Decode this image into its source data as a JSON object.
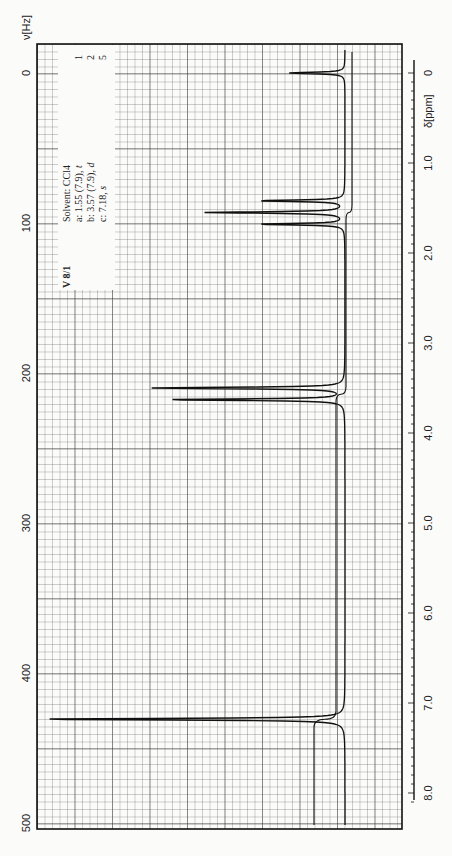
{
  "chart_data": {
    "type": "line",
    "spectrum_id": "V 8/1",
    "solvent": "Solvent: CCl4",
    "xlabel_hz": "ν[Hz]",
    "xlabel_ppm": "δ[ppm]",
    "hz_ticks": [
      0,
      100,
      200,
      300,
      400,
      500
    ],
    "hz_tick_labels": [
      "0",
      "100",
      "200",
      "300",
      "400",
      "500"
    ],
    "ppm_ticks": [
      0,
      1.0,
      2.0,
      3.0,
      4.0,
      5.0,
      6.0,
      7.0,
      8.0
    ],
    "ppm_tick_labels": [
      "0",
      "1.0",
      "2.0",
      "3.0",
      "4.0",
      "5.0",
      "6.0",
      "7.0",
      "8.0"
    ],
    "xlim_hz": [
      0,
      500
    ],
    "xlim_ppm": [
      0,
      8.33
    ],
    "grid": true,
    "assignments": [
      {
        "label": "a:",
        "text": "1.55 (7.9),",
        "mult": "t",
        "shift_ppm": 1.55,
        "J_hz": 7.9,
        "multiplicity": "t",
        "integral": 1
      },
      {
        "label": "b:",
        "text": "3.57 (7.9),",
        "mult": "d",
        "shift_ppm": 3.57,
        "J_hz": 7.9,
        "multiplicity": "d",
        "integral": 2
      },
      {
        "label": "c:",
        "text": "7.18,",
        "mult": "s",
        "shift_ppm": 7.18,
        "J_hz": null,
        "multiplicity": "s",
        "integral": 5
      }
    ],
    "integrals_labels": [
      "1",
      "2",
      "5"
    ],
    "peaks": [
      {
        "ppm": 0.0,
        "intensity": 0.18,
        "note": "TMS reference"
      },
      {
        "ppm": 1.42,
        "intensity": 0.28
      },
      {
        "ppm": 1.55,
        "intensity": 0.45
      },
      {
        "ppm": 1.68,
        "intensity": 0.28
      },
      {
        "ppm": 3.5,
        "intensity": 0.62
      },
      {
        "ppm": 3.63,
        "intensity": 0.58
      },
      {
        "ppm": 7.18,
        "intensity": 1.0
      }
    ]
  }
}
